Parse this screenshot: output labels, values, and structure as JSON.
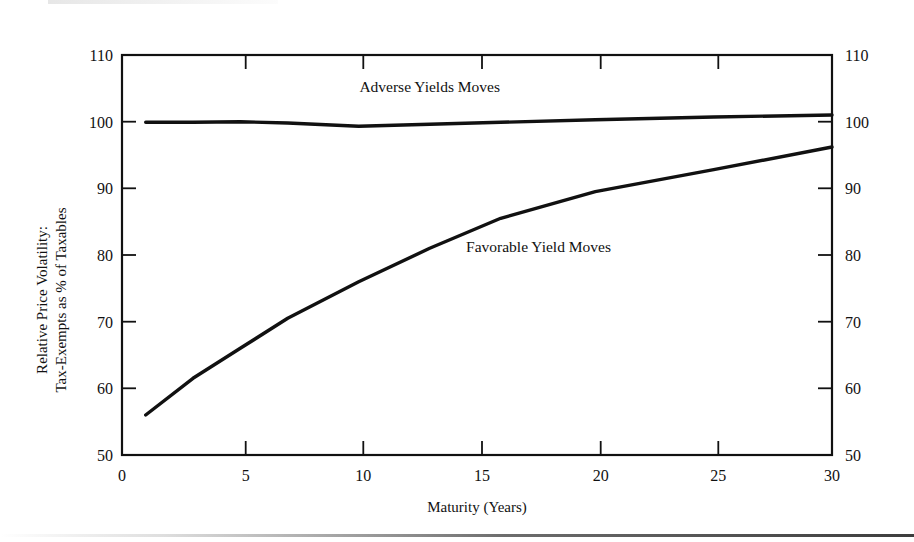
{
  "figure": {
    "background_color": "#ffffff",
    "ink_color": "#111111"
  },
  "chart_data": {
    "type": "line",
    "title": "",
    "subtitle": "",
    "xlabel": "Maturity (Years)",
    "ylabel": "Relative Price Volatility:",
    "ylabel_line2": "Tax-Exempts as % of Taxables",
    "xlim": [
      0,
      30
    ],
    "ylim": [
      50,
      110
    ],
    "xticks": [
      0,
      5,
      10,
      15,
      20,
      25,
      30
    ],
    "xticklabels": [
      "0",
      "5",
      "10",
      "15",
      "20",
      "25",
      "30"
    ],
    "yticks": [
      50,
      60,
      70,
      80,
      90,
      100,
      110
    ],
    "yticklabels": [
      "50",
      "60",
      "70",
      "80",
      "90",
      "100",
      "110"
    ],
    "right_axis_yticklabels": [
      "50",
      "60",
      "70",
      "80",
      "90",
      "100",
      "110"
    ],
    "grid": false,
    "legend_position": "inline-annotations",
    "series": [
      {
        "name": "Adverse Yields Moves",
        "label_text": "Adverse Yields Moves",
        "x": [
          1,
          3,
          5,
          7,
          10,
          13,
          16,
          20,
          25,
          30
        ],
        "values": [
          99.9,
          99.9,
          100.0,
          99.8,
          99.3,
          99.6,
          99.9,
          100.3,
          100.7,
          101.0
        ]
      },
      {
        "name": "Favorable Yield Moves",
        "label_text": "Favorable Yield Moves",
        "x": [
          1,
          3,
          5,
          7,
          10,
          13,
          16,
          20,
          25,
          30
        ],
        "values": [
          56.0,
          61.5,
          66.0,
          70.5,
          76.0,
          81.0,
          85.5,
          89.5,
          92.8,
          96.2
        ]
      }
    ],
    "annotations": [
      {
        "text": "Adverse Yields Moves",
        "x": 13.0,
        "y": 104.5
      },
      {
        "text": "Favorable Yield Moves",
        "x": 17.6,
        "y": 80.5
      }
    ]
  }
}
